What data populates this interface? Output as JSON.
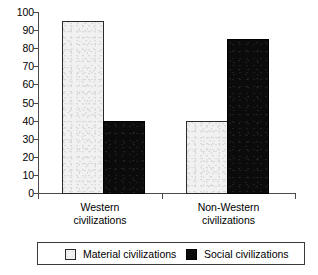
{
  "chart_data": {
    "type": "bar",
    "title": "",
    "subtitle": "",
    "xlabel": "",
    "ylabel": "",
    "ylim": [
      0,
      100
    ],
    "ytick_step": 10,
    "yticks": [
      0,
      10,
      20,
      30,
      40,
      50,
      60,
      70,
      80,
      90,
      100
    ],
    "grid": false,
    "legend_position": "bottom",
    "categories": [
      "Western civilizations",
      "Non-Western civilizations"
    ],
    "category_lines": [
      [
        "Western",
        "civilizations"
      ],
      [
        "Non-Western",
        "civilizations"
      ]
    ],
    "series": [
      {
        "name": "Material civilizations",
        "values": [
          95,
          40
        ],
        "color": "#f1f1f1",
        "border_color": "#2a2a2a"
      },
      {
        "name": "Social civilizations",
        "values": [
          40,
          85
        ],
        "color": "#0b0b0b",
        "border_color": "#000000"
      }
    ],
    "annotations": []
  },
  "axis": {
    "ticks": [
      {
        "label": "100",
        "value": 100
      },
      {
        "label": "90",
        "value": 90
      },
      {
        "label": "80",
        "value": 80
      },
      {
        "label": "70",
        "value": 70
      },
      {
        "label": "60",
        "value": 60
      },
      {
        "label": "50",
        "value": 50
      },
      {
        "label": "40",
        "value": 40
      },
      {
        "label": "30",
        "value": 30
      },
      {
        "label": "20",
        "value": 20
      },
      {
        "label": "10",
        "value": 10
      },
      {
        "label": "0",
        "value": 0
      }
    ]
  },
  "legend": {
    "items": [
      {
        "label": "Material civilizations",
        "swatch": "light-gray-swatch"
      },
      {
        "label": "Social civilizations",
        "swatch": "black-swatch"
      }
    ]
  }
}
